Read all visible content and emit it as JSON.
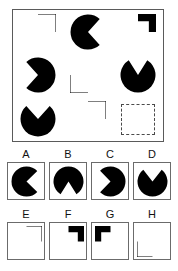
{
  "puzzle": {
    "type": "matrix-reasoning",
    "matrix": {
      "rows": 3,
      "columns": 3,
      "cells": [
        {
          "id": "cell-1-1",
          "shape": "circle-with-notch",
          "description": "black circle with lower-right quarter removed",
          "cut_start_deg": 0,
          "cut_end_deg": 90,
          "cut_kind": "quadrant",
          "filled": true
        },
        {
          "id": "cell-1-2",
          "shape": "pacman",
          "description": "black circle with wedge opening to the right",
          "cut_start_deg": -48,
          "cut_end_deg": 48,
          "cut_kind": "wedge",
          "filled": true
        },
        {
          "id": "cell-1-3",
          "shape": "circle-with-notch",
          "description": "black circle with small lower-right quarter notch",
          "cut_start_deg": 0,
          "cut_end_deg": 90,
          "cut_kind": "quadrant-small",
          "filled": true
        },
        {
          "id": "cell-2-1",
          "shape": "pacman",
          "description": "black circle with wedge opening to the left",
          "cut_start_deg": 132,
          "cut_end_deg": 228,
          "cut_kind": "wedge",
          "filled": true
        },
        {
          "id": "cell-2-2",
          "shape": "circle-with-notch",
          "description": "black circle with upper-left quarter removed",
          "cut_start_deg": 180,
          "cut_end_deg": 270,
          "cut_kind": "quadrant",
          "filled": true
        },
        {
          "id": "cell-2-3",
          "shape": "pacman",
          "description": "black circle with V wedge opening upward",
          "cut_start_deg": 58,
          "cut_end_deg": 122,
          "cut_kind": "wedge",
          "filled": true
        },
        {
          "id": "cell-3-1",
          "shape": "pacman",
          "description": "black circle with wide wedge opening upward",
          "cut_start_deg": 48,
          "cut_end_deg": 132,
          "cut_kind": "wedge",
          "filled": true
        },
        {
          "id": "cell-3-2",
          "shape": "circle-with-notch",
          "description": "black circle with lower-right quarter removed",
          "cut_start_deg": 0,
          "cut_end_deg": 90,
          "cut_kind": "quadrant",
          "filled": true
        },
        {
          "id": "cell-3-3",
          "shape": "empty",
          "description": "missing tile, dashed outline placeholder",
          "filled": false
        }
      ]
    },
    "options": [
      {
        "id": "option-a",
        "label": "A",
        "shape": "pacman",
        "description": "black circle with wedge opening to the right",
        "cut_start_deg": -44,
        "cut_end_deg": 44,
        "cut_kind": "wedge"
      },
      {
        "id": "option-b",
        "label": "B",
        "shape": "pacman",
        "description": "black circle with wedge opening downward",
        "cut_start_deg": 238,
        "cut_end_deg": 302,
        "cut_kind": "wedge"
      },
      {
        "id": "option-c",
        "label": "C",
        "shape": "pacman",
        "description": "black circle with wedge opening to the left",
        "cut_start_deg": 134,
        "cut_end_deg": 226,
        "cut_kind": "wedge"
      },
      {
        "id": "option-d",
        "label": "D",
        "shape": "pacman",
        "description": "black circle with wedge opening upward",
        "cut_start_deg": 52,
        "cut_end_deg": 128,
        "cut_kind": "wedge"
      },
      {
        "id": "option-e",
        "label": "E",
        "shape": "circle-with-notch",
        "description": "black circle with lower-right quarter removed",
        "cut_start_deg": 0,
        "cut_end_deg": 90,
        "cut_kind": "quadrant"
      },
      {
        "id": "option-f",
        "label": "F",
        "shape": "circle-with-notch",
        "description": "black circle with lower-right quarter removed, small notch",
        "cut_start_deg": 0,
        "cut_end_deg": 90,
        "cut_kind": "quadrant-small"
      },
      {
        "id": "option-g",
        "label": "G",
        "shape": "circle-with-notch",
        "description": "black circle with lower-left quarter removed",
        "cut_start_deg": 90,
        "cut_end_deg": 180,
        "cut_kind": "quadrant-small"
      },
      {
        "id": "option-h",
        "label": "H",
        "shape": "circle-with-notch",
        "description": "black circle with upper-left quarter removed",
        "cut_start_deg": 180,
        "cut_end_deg": 270,
        "cut_kind": "quadrant"
      }
    ],
    "colors": {
      "shape_fill": "#000000",
      "panel_border": "#5a5a5a",
      "option_border": "#6b6b6b",
      "empty_slot_border": "#4a4a4a",
      "background": "#ffffff",
      "label_text": "#111111"
    }
  }
}
